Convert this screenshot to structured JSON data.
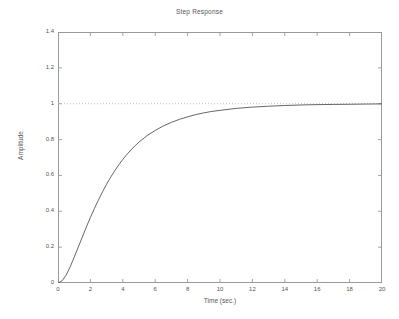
{
  "chart_data": {
    "type": "line",
    "title": "Step Response",
    "xlabel": "Time (sec.)",
    "ylabel": "Amplitude",
    "xlim": [
      0,
      20
    ],
    "ylim": [
      0,
      1.4
    ],
    "xticks": [
      0,
      2,
      4,
      6,
      8,
      10,
      12,
      14,
      16,
      18,
      20
    ],
    "xticklabels": [
      "0",
      "2",
      "4",
      "6",
      "8",
      "10",
      "12",
      "14",
      "16",
      "18",
      "20"
    ],
    "yticks": [
      0,
      0.2,
      0.4,
      0.6,
      0.8,
      1,
      1.2,
      1.4
    ],
    "yticklabels": [
      "0",
      "0.2",
      "0.4",
      "0.6",
      "0.8",
      "1",
      "1.2",
      "1.4"
    ],
    "grid": false,
    "legend": null,
    "box": true,
    "line_color": "#555555",
    "reference_line": {
      "name": "steady-state-reference",
      "y": 1,
      "style": "dotted",
      "color": "#b0b0b0"
    },
    "series": [
      {
        "name": "step-response",
        "color": "#555555",
        "x": [
          0,
          0.25,
          0.5,
          0.75,
          1,
          1.25,
          1.5,
          1.75,
          2,
          2.25,
          2.5,
          2.75,
          3,
          3.25,
          3.5,
          3.75,
          4,
          4.25,
          4.5,
          4.75,
          5,
          5.5,
          6,
          6.5,
          7,
          7.5,
          8,
          8.5,
          9,
          9.5,
          10,
          11,
          12,
          13,
          14,
          15,
          16,
          17,
          18,
          19,
          20
        ],
        "y": [
          0,
          0.012,
          0.044,
          0.09,
          0.144,
          0.2,
          0.256,
          0.312,
          0.366,
          0.416,
          0.464,
          0.509,
          0.551,
          0.59,
          0.626,
          0.659,
          0.689,
          0.717,
          0.742,
          0.765,
          0.786,
          0.822,
          0.851,
          0.876,
          0.896,
          0.913,
          0.927,
          0.939,
          0.949,
          0.957,
          0.963,
          0.974,
          0.981,
          0.986,
          0.99,
          0.993,
          0.995,
          0.996,
          0.997,
          0.998,
          0.999
        ]
      }
    ]
  }
}
